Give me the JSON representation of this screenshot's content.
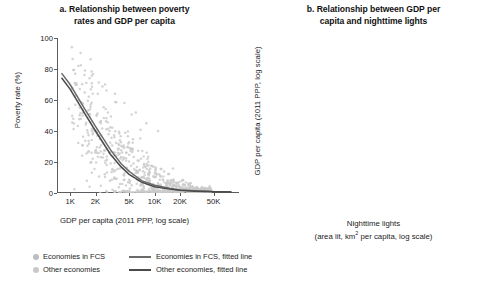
{
  "figure": {
    "background": "#ffffff",
    "colors": {
      "scatter_fcs": "#bdbdbd",
      "scatter_other": "#c9c9c9",
      "fitted_fcs": "#5f5f5f",
      "fitted_other": "#4a4a4a",
      "axis": "#5c5c5c",
      "text": "#1c1c1c"
    }
  },
  "legend": {
    "rows": [
      {
        "marker_label": "Economies in FCS",
        "line_label": "Economies in FCS, fitted line",
        "marker_color": "#bdbdbd",
        "line_color": "#6a6a6a"
      },
      {
        "marker_label": "Other economies",
        "line_label": "Other economies, fitted line",
        "marker_color": "#c9c9c9",
        "line_color": "#4a4a4a"
      }
    ]
  },
  "chart_data": [
    {
      "type": "scatter",
      "panel": "a",
      "title": "a. Relationship between poverty rates and GDP per capita",
      "title_lines": [
        "a. Relationship between poverty",
        "rates and GDP per capita"
      ],
      "xlabel": "GDP per capita (2011 PPP, log scale)",
      "xlabel_lines": [
        "GDP per capita (2011 PPP, log scale)"
      ],
      "ylabel": "Poverty rate (%)",
      "xscale": "log",
      "yscale": "linear",
      "grid": false,
      "legend_position": "below-figure",
      "ylim": [
        0,
        100
      ],
      "yticks": [
        0,
        20,
        40,
        60,
        80,
        100
      ],
      "yticklabels": [
        "0",
        "20",
        "40",
        "60",
        "80",
        "100"
      ],
      "xlim": [
        700,
        100000
      ],
      "xticks": [
        1000,
        2000,
        5000,
        10000,
        20000,
        50000
      ],
      "xticklabels": [
        "1K",
        "2K",
        "5K",
        "10K",
        "20K",
        "50K"
      ],
      "series": [
        {
          "name": "Economies in FCS",
          "marker_color": "#bdbdbd",
          "fitted_line_color": "#6a6a6a",
          "fitted_line": {
            "description": "Steeply declining curve from ~77% poverty at 1K GDP to ~1% at 50K+",
            "points": [
              [
                800,
                77
              ],
              [
                1000,
                70
              ],
              [
                1500,
                54
              ],
              [
                2000,
                43
              ],
              [
                3000,
                28
              ],
              [
                4000,
                19
              ],
              [
                5000,
                14
              ],
              [
                7000,
                8
              ],
              [
                10000,
                5
              ],
              [
                15000,
                3
              ],
              [
                20000,
                2
              ],
              [
                30000,
                1.5
              ],
              [
                50000,
                1
              ],
              [
                80000,
                0.8
              ]
            ]
          }
        },
        {
          "name": "Other economies",
          "marker_color": "#c9c9c9",
          "fitted_line_color": "#4a4a4a",
          "fitted_line": {
            "description": "Steeply declining curve slightly below the FCS line",
            "points": [
              [
                800,
                74
              ],
              [
                1000,
                67
              ],
              [
                1500,
                51
              ],
              [
                2000,
                40
              ],
              [
                3000,
                25
              ],
              [
                4000,
                17
              ],
              [
                5000,
                12
              ],
              [
                7000,
                7
              ],
              [
                10000,
                4
              ],
              [
                15000,
                2.5
              ],
              [
                20000,
                1.8
              ],
              [
                30000,
                1.2
              ],
              [
                50000,
                0.8
              ],
              [
                80000,
                0.6
              ]
            ]
          }
        }
      ],
      "scatter_description": "Dense cloud of ~800 gray points, highest poverty (60-95%) at low GDP (800-3K), declining to near 0% above 10K GDP; vertical spread widest between 2K and 8K."
    },
    {
      "type": "scatter",
      "panel": "b",
      "title": "b. Relationship between GDP per capita and nighttime lights",
      "title_lines": [
        "b. Relationship between GDP per",
        "capita and nighttime lights"
      ],
      "xlabel": "Nighttime lights (area lit, km² per capita, log scale)",
      "xlabel_lines": [
        "Nighttime lights",
        "(area lit, km² per capita, log scale)"
      ],
      "ylabel": "GDP per capita (2011 PPP, log scale)",
      "xscale": "linear",
      "yscale": "log",
      "grid": false,
      "legend_position": "below-figure",
      "ylim": [
        500,
        150000
      ],
      "yticks": [
        1000,
        2000,
        5000,
        10000,
        20000,
        50000,
        100000
      ],
      "yticklabels": [
        "1,000",
        "2,000",
        "5,000",
        "10,000",
        "20,000",
        "50,000",
        "100,000"
      ],
      "xlim": [
        -3,
        9
      ],
      "xticks": [
        -2,
        0,
        2,
        4,
        6,
        8
      ],
      "xticklabels": [
        "−2",
        "0",
        "2",
        "4",
        "6",
        "8"
      ],
      "series": [
        {
          "name": "Other economies",
          "marker_color": "#bdbdbd",
          "fitted_line_color": "#4a4a4a",
          "fitted_line": {
            "description": "Upward convex curve from ~600 GDP at -2.5 lights to ~110,000 at 8 lights",
            "points": [
              [
                -2.6,
                620
              ],
              [
                -2,
                780
              ],
              [
                -1,
                1050
              ],
              [
                0,
                1500
              ],
              [
                1,
                2200
              ],
              [
                2,
                3400
              ],
              [
                3,
                5400
              ],
              [
                4,
                9000
              ],
              [
                5,
                16000
              ],
              [
                6,
                30000
              ],
              [
                7,
                60000
              ],
              [
                7.8,
                110000
              ]
            ]
          }
        }
      ],
      "scatter_description": "Dense upward-sloping gray cloud centered on the fitted curve; main mass between lights 1 and 6, GDP 1,000-60,000; sparse outlier streak near lights 2-3 rising to 100,000."
    }
  ]
}
